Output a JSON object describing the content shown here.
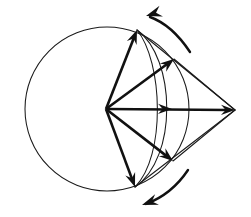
{
  "figure": {
    "canvas": {
      "width": 251,
      "height": 217,
      "background": "#ffffff"
    },
    "colors": {
      "ink": "#111111",
      "thin_ink": "#1a1a1a",
      "background": "#ffffff"
    },
    "stroke_widths": {
      "thin": 1.05,
      "thick": 2.6,
      "curve": 2.4
    },
    "points": {
      "center": {
        "name": "origin-vertex",
        "x": 106,
        "y": 109
      },
      "right": {
        "name": "right-vertex",
        "x": 235,
        "y": 110
      },
      "top": {
        "name": "top-vertex",
        "x": 137,
        "y": 30
      },
      "bottom": {
        "name": "bottom-vertex",
        "x": 135,
        "y": 187
      },
      "upper_mid": {
        "name": "upper-mid-vertex",
        "x": 174,
        "y": 59
      },
      "lower_mid": {
        "name": "lower-mid-vertex",
        "x": 173,
        "y": 161
      }
    },
    "circle": {
      "name": "main-circle",
      "cx": 107,
      "cy": 109,
      "r": 82
    },
    "arcs": [
      {
        "name": "inner-arc",
        "from_point": "top",
        "to_point": "bottom",
        "d": "M 137 30 C 176 58 178 158 135 187"
      },
      {
        "name": "outer-arc",
        "from_point": "top",
        "to_point": "bottom",
        "d": "M 137 30 C 163 62 166 156 135 187"
      }
    ],
    "thick_vectors": [
      {
        "name": "vector-to-right",
        "from": "center",
        "to": "right",
        "label": ""
      },
      {
        "name": "vector-to-top",
        "from": "center",
        "to": "top",
        "label": ""
      },
      {
        "name": "vector-to-upper-mid",
        "from": "center",
        "to": "upper_mid",
        "label": ""
      },
      {
        "name": "vector-to-bottom",
        "from": "center",
        "to": "bottom",
        "label": ""
      },
      {
        "name": "vector-to-lower-mid",
        "from": "center",
        "to": "lower_mid",
        "label": ""
      }
    ],
    "thin_edges": [
      {
        "name": "edge-top-to-right",
        "from": "top",
        "to": "right"
      },
      {
        "name": "edge-bottom-to-right",
        "from": "bottom",
        "to": "right"
      },
      {
        "name": "edge-upper-mid-to-right",
        "from": "upper_mid",
        "to": "right"
      },
      {
        "name": "edge-lower-mid-to-right",
        "from": "lower_mid",
        "to": "right"
      },
      {
        "name": "edge-center-to-top",
        "from": "center",
        "to": "top"
      },
      {
        "name": "edge-center-to-bottom",
        "from": "center",
        "to": "bottom"
      }
    ],
    "rotation_arrows": [
      {
        "name": "rotation-arrow-top",
        "direction": "counterclockwise",
        "d": "M 190 52 C 178 34 164 22 150 17",
        "head_x": 146,
        "head_y": 16,
        "head_angle": -198
      },
      {
        "name": "rotation-arrow-bottom",
        "direction": "counterclockwise",
        "d": "M 188 170 C 176 188 162 198 146 204",
        "head_x": 142,
        "head_y": 205,
        "head_angle": 160
      }
    ],
    "arrowheads": [
      {
        "name": "arrowhead-right",
        "at": "right",
        "angle": 0.4
      },
      {
        "name": "arrowhead-top",
        "at": "top",
        "angle": -68
      },
      {
        "name": "arrowhead-upper-mid",
        "at": "upper_mid",
        "angle": -38
      },
      {
        "name": "arrowhead-bottom",
        "at": "bottom",
        "angle": 70
      },
      {
        "name": "arrowhead-lower-mid",
        "at": "lower_mid",
        "angle": 39
      },
      {
        "name": "arrowhead-midline",
        "at_x": 172,
        "at_y": 109,
        "angle": 0.4
      }
    ]
  }
}
